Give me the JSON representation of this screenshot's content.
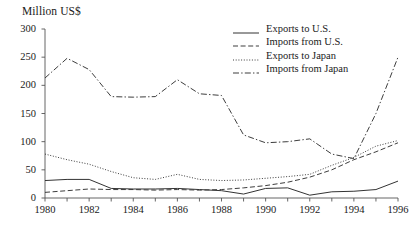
{
  "chart_data": {
    "type": "line",
    "title": "",
    "ylabel": "Million US$",
    "xlabel": "",
    "ylim": [
      0,
      300
    ],
    "yticks": [
      0,
      50,
      100,
      150,
      200,
      250,
      300
    ],
    "xlim": [
      1980,
      1996
    ],
    "x": [
      1980,
      1981,
      1982,
      1983,
      1984,
      1985,
      1986,
      1987,
      1988,
      1989,
      1990,
      1991,
      1992,
      1993,
      1994,
      1995,
      1996
    ],
    "xticks": [
      1980,
      1981,
      1982,
      1983,
      1984,
      1985,
      1986,
      1987,
      1988,
      1989,
      1990,
      1991,
      1992,
      1993,
      1994,
      1995,
      1996
    ],
    "xtick_labels": [
      "1980",
      "",
      "1982",
      "",
      "1984",
      "",
      "1986",
      "",
      "1988",
      "",
      "1990",
      "",
      "1992",
      "",
      "1994",
      "",
      "1996"
    ],
    "grid": false,
    "legend_position": "upper right",
    "series": [
      {
        "name": "Exports to U.S.",
        "style": "solid",
        "color": "#333333",
        "values": [
          31,
          33,
          33,
          17,
          16,
          16,
          17,
          15,
          13,
          7,
          17,
          18,
          5,
          11,
          12,
          15,
          30
        ]
      },
      {
        "name": "Imports from U.S.",
        "style": "dashed",
        "color": "#333333",
        "values": [
          10,
          13,
          16,
          15,
          15,
          14,
          15,
          14,
          15,
          18,
          22,
          28,
          37,
          50,
          68,
          82,
          98
        ]
      },
      {
        "name": "Exports to Japan",
        "style": "dotted",
        "color": "#333333",
        "values": [
          78,
          68,
          60,
          47,
          36,
          33,
          42,
          33,
          31,
          32,
          35,
          38,
          42,
          58,
          72,
          92,
          102
        ]
      },
      {
        "name": "Imports from Japan",
        "style": "dashdot",
        "color": "#333333",
        "values": [
          213,
          248,
          228,
          180,
          179,
          180,
          210,
          185,
          182,
          112,
          98,
          100,
          105,
          78,
          70,
          150,
          250
        ]
      }
    ]
  }
}
